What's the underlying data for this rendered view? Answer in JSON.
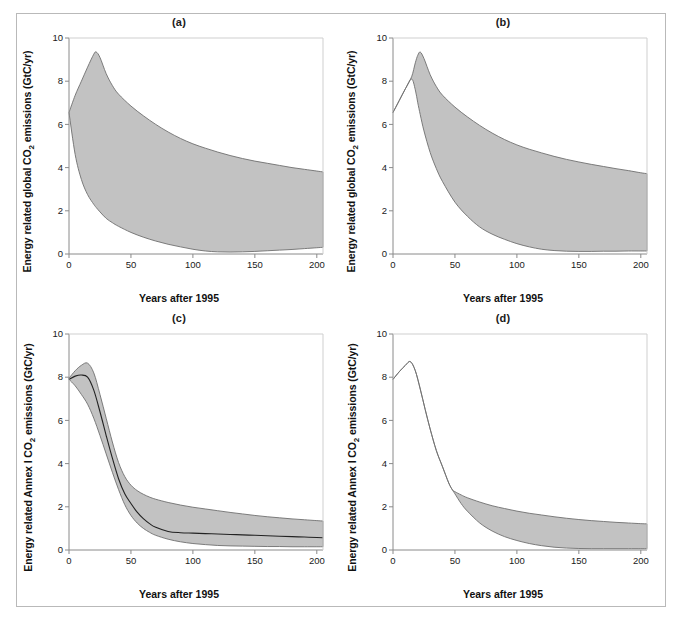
{
  "figure": {
    "background_color": "#ffffff",
    "frame_color": "#b9b9b9",
    "band_fill_color": "#c2c2c2",
    "band_edge_color": "#6f6f6f",
    "median_line_color": "#222222",
    "axis_color": "#8a8a8a"
  },
  "chart_data": [
    {
      "type": "area",
      "panel": "a",
      "title": "(a)",
      "xlabel": "Years after 1995",
      "ylabel": "Energy related global CO2 emissions (GtC/yr)",
      "ylabel_html": "Energy related global CO<sub>2</sub> emissions (GtC/yr)",
      "xlim": [
        0,
        205
      ],
      "ylim": [
        0,
        10
      ],
      "xticks": [
        0,
        50,
        100,
        150,
        200
      ],
      "yticks": [
        0,
        2,
        4,
        6,
        8,
        10
      ],
      "grid": false,
      "legend": "none",
      "x": [
        0,
        5,
        10,
        15,
        20,
        22,
        25,
        30,
        35,
        40,
        50,
        60,
        70,
        80,
        90,
        100,
        110,
        120,
        130,
        140,
        150,
        160,
        170,
        180,
        190,
        200,
        205
      ],
      "series": [
        {
          "name": "upper bound",
          "values": [
            6.55,
            7.35,
            8.0,
            8.65,
            9.25,
            9.35,
            9.1,
            8.35,
            7.8,
            7.4,
            6.85,
            6.4,
            6.0,
            5.65,
            5.35,
            5.1,
            4.9,
            4.72,
            4.56,
            4.42,
            4.3,
            4.2,
            4.1,
            4.0,
            3.92,
            3.84,
            3.8
          ]
        },
        {
          "name": "lower bound",
          "values": [
            6.55,
            4.6,
            3.45,
            2.75,
            2.3,
            2.15,
            1.95,
            1.65,
            1.45,
            1.28,
            1.0,
            0.78,
            0.6,
            0.45,
            0.33,
            0.22,
            0.14,
            0.1,
            0.09,
            0.1,
            0.12,
            0.15,
            0.18,
            0.21,
            0.25,
            0.29,
            0.31
          ]
        }
      ]
    },
    {
      "type": "area",
      "panel": "b",
      "title": "(b)",
      "xlabel": "Years after 1995",
      "ylabel": "Energy related global CO2 emissions (GtC/yr)",
      "ylabel_html": "Energy related global CO<sub>2</sub> emissions (GtC/yr)",
      "xlim": [
        0,
        205
      ],
      "ylim": [
        0,
        10
      ],
      "xticks": [
        0,
        50,
        100,
        150,
        200
      ],
      "yticks": [
        0,
        2,
        4,
        6,
        8,
        10
      ],
      "grid": false,
      "legend": "none",
      "x": [
        0,
        5,
        10,
        15,
        18,
        20,
        22,
        25,
        30,
        35,
        40,
        50,
        60,
        70,
        80,
        90,
        100,
        110,
        120,
        130,
        140,
        150,
        160,
        170,
        180,
        190,
        200,
        205
      ],
      "series": [
        {
          "name": "upper bound",
          "values": [
            6.55,
            7.1,
            7.65,
            8.2,
            8.85,
            9.2,
            9.35,
            9.05,
            8.3,
            7.75,
            7.35,
            6.8,
            6.35,
            5.95,
            5.6,
            5.3,
            5.05,
            4.85,
            4.68,
            4.52,
            4.38,
            4.26,
            4.15,
            4.05,
            3.95,
            3.86,
            3.76,
            3.72
          ]
        },
        {
          "name": "lower bound",
          "values": [
            6.55,
            7.1,
            7.65,
            8.1,
            7.6,
            7.0,
            6.45,
            5.7,
            4.7,
            3.95,
            3.35,
            2.4,
            1.75,
            1.25,
            0.92,
            0.68,
            0.48,
            0.33,
            0.22,
            0.16,
            0.13,
            0.12,
            0.12,
            0.13,
            0.13,
            0.14,
            0.14,
            0.14
          ]
        }
      ]
    },
    {
      "type": "area",
      "panel": "c",
      "title": "(c)",
      "xlabel": "Years after 1995",
      "ylabel": "Energy related Annex I CO2 emissions (GtC/yr)",
      "ylabel_html": "Energy related Annex I CO<sub>2</sub> emissions (GtC/yr)",
      "xlim": [
        0,
        205
      ],
      "ylim": [
        0,
        10
      ],
      "xticks": [
        0,
        50,
        100,
        150,
        200
      ],
      "yticks": [
        0,
        2,
        4,
        6,
        8,
        10
      ],
      "grid": false,
      "legend": "none",
      "x": [
        0,
        5,
        10,
        15,
        20,
        25,
        30,
        35,
        40,
        45,
        50,
        55,
        60,
        65,
        70,
        80,
        90,
        100,
        110,
        120,
        130,
        140,
        150,
        160,
        170,
        180,
        190,
        200,
        205
      ],
      "series": [
        {
          "name": "upper bound",
          "values": [
            7.95,
            8.3,
            8.55,
            8.65,
            8.2,
            7.2,
            6.1,
            5.0,
            4.05,
            3.4,
            3.0,
            2.75,
            2.58,
            2.45,
            2.35,
            2.2,
            2.08,
            1.98,
            1.9,
            1.82,
            1.74,
            1.67,
            1.6,
            1.54,
            1.49,
            1.44,
            1.4,
            1.36,
            1.34
          ]
        },
        {
          "name": "median",
          "values": [
            7.9,
            8.05,
            8.1,
            8.0,
            7.4,
            6.4,
            5.3,
            4.25,
            3.3,
            2.6,
            2.15,
            1.75,
            1.45,
            1.22,
            1.05,
            0.86,
            0.8,
            0.78,
            0.76,
            0.74,
            0.72,
            0.7,
            0.68,
            0.66,
            0.64,
            0.62,
            0.6,
            0.58,
            0.57
          ]
        },
        {
          "name": "lower bound",
          "values": [
            7.9,
            7.6,
            7.2,
            6.75,
            6.1,
            5.3,
            4.45,
            3.6,
            2.8,
            2.1,
            1.6,
            1.25,
            1.0,
            0.82,
            0.68,
            0.5,
            0.38,
            0.3,
            0.25,
            0.21,
            0.19,
            0.18,
            0.17,
            0.16,
            0.16,
            0.15,
            0.15,
            0.15,
            0.15
          ]
        }
      ]
    },
    {
      "type": "area",
      "panel": "d",
      "title": "(d)",
      "xlabel": "Years after 1995",
      "ylabel": "Energy related Annex I CO2 emissions (GtC/yr)",
      "ylabel_html": "Energy related Annex I CO<sub>2</sub> emissions (GtC/yr)",
      "xlim": [
        0,
        205
      ],
      "ylim": [
        0,
        10
      ],
      "xticks": [
        0,
        50,
        100,
        150,
        200
      ],
      "yticks": [
        0,
        2,
        4,
        6,
        8,
        10
      ],
      "grid": false,
      "legend": "none",
      "x": [
        0,
        5,
        10,
        14,
        18,
        22,
        26,
        30,
        35,
        40,
        45,
        48,
        50,
        55,
        60,
        70,
        80,
        90,
        100,
        110,
        120,
        130,
        140,
        150,
        160,
        170,
        180,
        190,
        200,
        205
      ],
      "series": [
        {
          "name": "upper bound",
          "values": [
            7.9,
            8.25,
            8.55,
            8.72,
            8.3,
            7.45,
            6.5,
            5.6,
            4.6,
            3.85,
            3.1,
            2.78,
            2.7,
            2.55,
            2.42,
            2.22,
            2.05,
            1.92,
            1.8,
            1.7,
            1.62,
            1.54,
            1.47,
            1.41,
            1.36,
            1.32,
            1.28,
            1.25,
            1.22,
            1.21
          ]
        },
        {
          "name": "lower bound",
          "values": [
            7.9,
            8.25,
            8.55,
            8.72,
            8.3,
            7.45,
            6.5,
            5.6,
            4.6,
            3.85,
            3.1,
            2.78,
            2.6,
            2.15,
            1.8,
            1.25,
            0.88,
            0.62,
            0.44,
            0.3,
            0.2,
            0.13,
            0.09,
            0.07,
            0.06,
            0.06,
            0.06,
            0.06,
            0.06,
            0.06
          ]
        }
      ]
    }
  ]
}
